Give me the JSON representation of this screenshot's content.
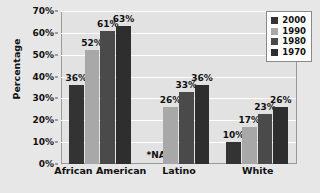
{
  "chart_data": {
    "type": "bar",
    "title": "",
    "xlabel": "",
    "ylabel": "Percentage",
    "categories": [
      "African American",
      "Latino",
      "White"
    ],
    "series": [
      {
        "name": "2000",
        "color": "#333333",
        "values": [
          36,
          null,
          10
        ],
        "labels": [
          "36%",
          "*NA",
          "10%"
        ]
      },
      {
        "name": "1990",
        "color": "#a8a8a8",
        "values": [
          52,
          26,
          17
        ],
        "labels": [
          "52%",
          "26%",
          "17%"
        ]
      },
      {
        "name": "1980",
        "color": "#4a4a4a",
        "values": [
          61,
          33,
          23
        ],
        "labels": [
          "61%",
          "33%",
          "23%"
        ]
      },
      {
        "name": "1970",
        "color": "#2e2e2e",
        "values": [
          63,
          36,
          26
        ],
        "labels": [
          "63%",
          "36%",
          "26%"
        ]
      }
    ],
    "ylim": [
      0,
      70
    ],
    "yticks": [
      0,
      10,
      20,
      30,
      40,
      50,
      60,
      70
    ],
    "ytick_labels": [
      "0%",
      "10%",
      "20%",
      "30%",
      "40%",
      "50%",
      "60%",
      "70%"
    ],
    "grid": true,
    "legend_position": "top-right",
    "na_note": "*NA",
    "plot_background": "#e2e2e2",
    "figure_background": "#e7e7e7",
    "gridline_color": "#ffffff"
  }
}
